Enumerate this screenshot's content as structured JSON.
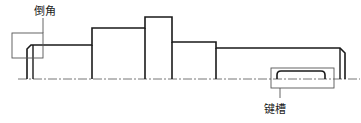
{
  "diagram": {
    "type": "stepped shaft drawing",
    "labels": {
      "chamfer": "倒角",
      "keyway": "键槽"
    },
    "colors": {
      "line": "#1a1a1a",
      "leader": "#555555",
      "centerline": "#777777"
    }
  }
}
